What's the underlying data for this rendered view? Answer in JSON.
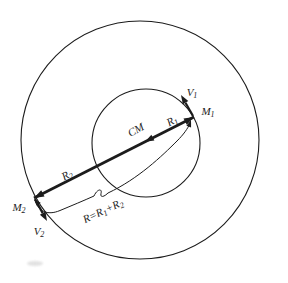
{
  "figure": {
    "colors": {
      "stroke": "#1c1c1c",
      "background": "#ffffff"
    },
    "labels": {
      "v1": {
        "base": "V",
        "sub": "1"
      },
      "m1": {
        "base": "M",
        "sub": "1"
      },
      "cm": {
        "text": "CM"
      },
      "r1": {
        "base": "R",
        "sub": "1"
      },
      "r2": {
        "base": "R",
        "sub": "2"
      },
      "m2": {
        "base": "M",
        "sub": "2"
      },
      "v2": {
        "base": "V",
        "sub": "2"
      },
      "r_total": {
        "p1": "R=R",
        "sub1": "1",
        "p2": "+R",
        "sub2": "2"
      }
    }
  }
}
